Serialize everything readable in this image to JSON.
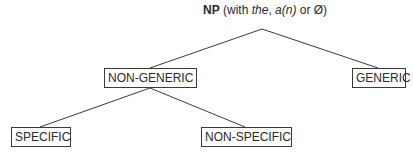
{
  "diagram": {
    "type": "tree",
    "root": {
      "label_bold": "NP",
      "label_pre": " (with ",
      "label_the": "the",
      "label_sep": ", ",
      "label_an": "a(n)",
      "label_or": " or Ø)"
    },
    "nodes": [
      {
        "id": "non-generic",
        "label": "NON-GENERIC",
        "parent": "root"
      },
      {
        "id": "generic",
        "label": "GENERIC",
        "parent": "root"
      },
      {
        "id": "specific",
        "label": "SPECIFIC",
        "parent": "non-generic"
      },
      {
        "id": "non-specific",
        "label": "NON-SPECIFIC",
        "parent": "non-generic"
      }
    ],
    "colors": {
      "line": "#3a3a3a",
      "text": "#2a2a2a",
      "background": "#ffffff"
    }
  }
}
